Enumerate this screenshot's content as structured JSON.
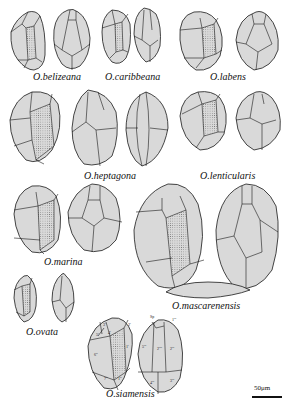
{
  "figure": {
    "species": [
      {
        "name": "O.belizeana"
      },
      {
        "name": "O.caribbeana"
      },
      {
        "name": "O.labens"
      },
      {
        "name": "O.heptagona"
      },
      {
        "name": "O.lenticularis"
      },
      {
        "name": "O.marina"
      },
      {
        "name": "O.mascarenensis"
      },
      {
        "name": "O.ovata"
      },
      {
        "name": "O.siamensis"
      }
    ],
    "plate_labels": {
      "epi": [
        "3'",
        "2'",
        "4'",
        "5'",
        "6\"",
        "7\"",
        "1\"",
        "2\"",
        "1'"
      ],
      "hypo": [
        "Sp",
        "1'''",
        "5'''",
        "2''''",
        "2'''",
        "4'''",
        "3'''"
      ]
    },
    "scale_bar": "50μm",
    "colors": {
      "cell_fill": "#d9d9d9",
      "outline": "#1a1a1a"
    }
  }
}
